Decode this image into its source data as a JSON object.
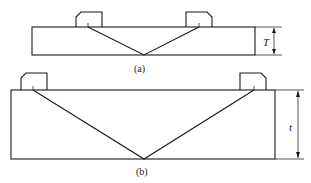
{
  "figure": {
    "panel_a": {
      "label": "(a)",
      "dimension_label": "T",
      "description": "Thin plate with two angle-beam probes, single bottom reflection"
    },
    "panel_b": {
      "label": "(b)",
      "dimension_label": "t",
      "description": "Thick plate with two angle-beam probes, single bottom reflection"
    },
    "colors": {
      "line": "#1a1a1a",
      "background": "#ffffff"
    }
  }
}
